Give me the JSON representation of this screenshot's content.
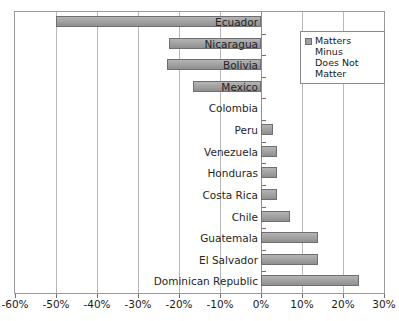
{
  "chart_data": {
    "type": "bar",
    "orientation": "horizontal",
    "title": "",
    "subtitle": "",
    "xlabel": "",
    "ylabel": "",
    "xlim": [
      -60,
      30
    ],
    "xtick_step": 10,
    "xtick_labels": [
      "-60%",
      "-50%",
      "-40%",
      "-30%",
      "-20%",
      "-10%",
      "0%",
      "10%",
      "20%",
      "30%"
    ],
    "xtick_values": [
      -60,
      -50,
      -40,
      -30,
      -20,
      -10,
      0,
      10,
      20,
      30
    ],
    "grid": true,
    "grid_axis": "x",
    "legend_position": "top-right",
    "categories": [
      "Ecuador",
      "Nicaragua",
      "Bolivia",
      "Mexico",
      "Colombia",
      "Peru",
      "Venezuela",
      "Honduras",
      "Costa Rica",
      "Chile",
      "Guatemala",
      "El Salvador",
      "Dominican Republic"
    ],
    "series": [
      {
        "name": "Matters Minus Does Not Matter",
        "color": "#a0a0a0",
        "values": [
          -50,
          -22.5,
          -23,
          -16.5,
          0,
          3,
          4,
          4,
          4,
          7,
          14,
          14,
          24
        ]
      }
    ]
  },
  "legend": {
    "entries": [
      {
        "label": "Matters Minus\nDoes Not\nMatter",
        "color": "#a0a0a0"
      }
    ]
  },
  "colors": {
    "bar_fill": "#a0a0a0",
    "bar_border": "#6f6f6f",
    "gridline": "#b8b8b8",
    "axis": "#8f8f8f",
    "text": "#1a1a1a",
    "background": "#ffffff"
  }
}
